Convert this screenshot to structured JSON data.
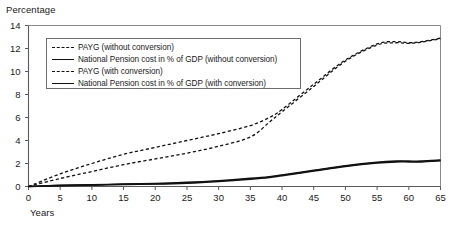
{
  "chart_data": {
    "type": "line",
    "title": "",
    "ylabel": "Percentage",
    "xlabel": "Years",
    "xlim": [
      0,
      65
    ],
    "ylim": [
      0,
      14
    ],
    "grid": false,
    "legend_position": "upper-left-inside",
    "xticks": [
      0,
      5,
      10,
      15,
      20,
      25,
      30,
      35,
      40,
      45,
      50,
      55,
      60,
      65
    ],
    "yticks": [
      0,
      2,
      4,
      6,
      8,
      10,
      12,
      14
    ],
    "x": [
      0,
      5,
      10,
      15,
      20,
      25,
      30,
      35,
      38,
      40,
      45,
      50,
      55,
      58,
      60,
      62,
      65
    ],
    "series": [
      {
        "name": "PAYG (without conversion)",
        "style": "dashed",
        "values": [
          0.0,
          1.1,
          2.0,
          2.8,
          3.4,
          4.0,
          4.6,
          5.3,
          6.0,
          6.7,
          8.9,
          11.0,
          12.4,
          12.6,
          12.5,
          12.6,
          12.9
        ]
      },
      {
        "name": "National Pension cost in % of GDP (without conversion)",
        "style": "solid",
        "values": [
          0.0,
          0.1,
          0.15,
          0.2,
          0.25,
          0.35,
          0.5,
          0.7,
          0.85,
          1.0,
          1.4,
          1.8,
          2.1,
          2.2,
          2.2,
          2.2,
          2.3
        ]
      },
      {
        "name": "PAYG (with conversion)",
        "style": "dashed",
        "values": [
          0.0,
          0.7,
          1.3,
          1.9,
          2.4,
          2.9,
          3.5,
          4.3,
          5.6,
          6.5,
          8.7,
          10.9,
          12.3,
          12.5,
          12.45,
          12.55,
          12.85
        ]
      },
      {
        "name": "National Pension cost in % of GDP (with conversion)",
        "style": "solid",
        "values": [
          0.0,
          0.08,
          0.12,
          0.18,
          0.22,
          0.3,
          0.45,
          0.65,
          0.8,
          0.95,
          1.35,
          1.75,
          2.05,
          2.15,
          2.15,
          2.15,
          2.25
        ]
      }
    ]
  },
  "legend": {
    "items": [
      {
        "label": "PAYG (without conversion)",
        "style": "dashed"
      },
      {
        "label": "National Pension cost in % of GDP (without conversion)",
        "style": "solid"
      },
      {
        "label": "PAYG (with conversion)",
        "style": "dashed"
      },
      {
        "label": "National Pension cost in % of GDP (with conversion)",
        "style": "solid"
      }
    ]
  },
  "colors": {
    "line": "#111111",
    "axis": "#5a5a5a",
    "frame": "#8a8a8a",
    "background": "#ffffff"
  }
}
